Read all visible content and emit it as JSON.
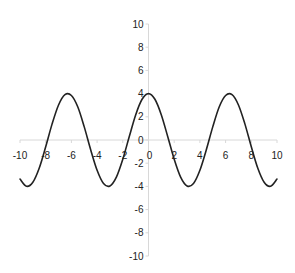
{
  "chart_data": {
    "type": "line",
    "title": "",
    "xlabel": "",
    "ylabel": "",
    "function": "y = 4cos(x)",
    "xlim": [
      -10,
      10
    ],
    "ylim": [
      -10,
      10
    ],
    "grid": false,
    "legend": null,
    "x_ticks": [
      -10,
      -8,
      -6,
      -4,
      -2,
      0,
      2,
      4,
      6,
      8,
      10
    ],
    "y_ticks": [
      10,
      8,
      6,
      4,
      2,
      0,
      -2,
      -4,
      -6,
      -8,
      -10
    ],
    "series": [
      {
        "name": "y",
        "color": "#222222",
        "x": [
          -10,
          -9.5,
          -9,
          -8.5,
          -8,
          -7.5,
          -7,
          -6.5,
          -6,
          -5.5,
          -5,
          -4.5,
          -4,
          -3.5,
          -3,
          -2.5,
          -2,
          -1.5,
          -1,
          -0.5,
          0,
          0.5,
          1,
          1.5,
          2,
          2.5,
          3,
          3.5,
          4,
          4.5,
          5,
          5.5,
          6,
          6.5,
          7,
          7.5,
          8,
          8.5,
          9,
          9.5,
          10
        ],
        "y": [
          -3.36,
          -3.99,
          -3.64,
          -2.41,
          -0.58,
          1.39,
          3.02,
          3.91,
          3.84,
          2.85,
          1.13,
          -0.84,
          -2.61,
          -3.75,
          -3.96,
          -3.2,
          -1.66,
          0.28,
          2.16,
          3.51,
          4.0,
          3.51,
          2.16,
          0.28,
          -1.66,
          -3.2,
          -3.96,
          -3.75,
          -2.61,
          -0.84,
          1.13,
          2.85,
          3.84,
          3.91,
          3.02,
          1.39,
          -0.58,
          -2.41,
          -3.64,
          -3.99,
          -3.36
        ]
      }
    ]
  },
  "colors": {
    "axis": "#d8d8d8",
    "line": "#222222",
    "text": "#222222"
  }
}
